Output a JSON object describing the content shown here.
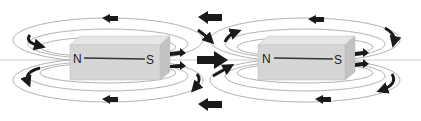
{
  "diagram": {
    "colors": {
      "background": "#ffffff",
      "magnet_front": "#d6d6d6",
      "magnet_top": "#e6e6e6",
      "magnet_side": "#c2c2c2",
      "field_line": "#9a9a9a",
      "arrow": "#1a1a1a"
    },
    "magnets": [
      {
        "id": "left",
        "north_label": "N",
        "south_label": "S"
      },
      {
        "id": "right",
        "north_label": "N",
        "south_label": "S"
      }
    ]
  }
}
